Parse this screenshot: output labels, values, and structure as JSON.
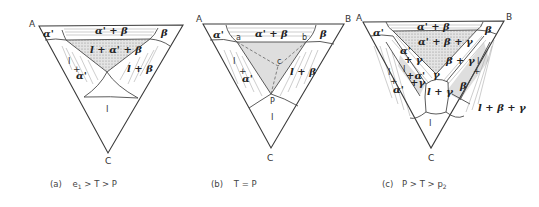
{
  "figure": {
    "vertices": {
      "A": "A",
      "B": "B",
      "C": "C"
    },
    "panels": [
      {
        "id": "a",
        "caption": "(a)  e₁ > T > P",
        "caption_parts": {
          "tag": "(a)",
          "cond": "e",
          "sub": "1",
          "rest": " > T > P"
        },
        "regions": [
          "α'",
          "α' + β",
          "β",
          "l + α' + β",
          "l + α'",
          "l + β",
          "l"
        ],
        "labels": {
          "alpha": "α'",
          "alpha_beta": "α' + β",
          "beta": "β",
          "l_alpha_beta": "l + α' + β",
          "l_alpha_l": "l",
          "l_alpha_plus": "+",
          "l_alpha_a": "α'",
          "l_beta": "l + β",
          "l": "l"
        }
      },
      {
        "id": "b",
        "caption": "(b)  T = P",
        "caption_parts": {
          "tag": "(b)",
          "cond": "T = P"
        },
        "regions": [
          "α'",
          "α' + β",
          "β",
          "l + α'",
          "l + β",
          "l"
        ],
        "points": {
          "a": "a",
          "b": "b",
          "c": "c",
          "P": "P"
        },
        "labels": {
          "alpha": "α'",
          "alpha_beta": "α' + β",
          "beta": "β",
          "l_alpha_l": "l",
          "l_alpha_plus": "+",
          "l_alpha_a": "α'",
          "l_beta": "l + β",
          "l": "l"
        }
      },
      {
        "id": "c",
        "caption": "(c)  P > T > p₂",
        "caption_parts": {
          "tag": "(c)",
          "cond": "P > T > p",
          "sub": "2"
        },
        "regions": [
          "α'",
          "α' + β",
          "β",
          "α' + β + γ",
          "α' + γ",
          "β + γ",
          "γ",
          "l + α' + γ",
          "l + γ",
          "l + α'",
          "l + β",
          "l + β + γ",
          "l"
        ],
        "labels": {
          "alpha": "α'",
          "alpha_beta": "α' + β",
          "beta": "β",
          "alpha_beta_gamma": "α' + β + γ",
          "alpha_gamma_a": "α'",
          "alpha_gamma_g": "+ γ",
          "beta_gamma": "β + γ",
          "gamma": "γ",
          "l_alpha_gamma_l": "l",
          "l_alpha_gamma_a": "+α'",
          "l_alpha_gamma_g": "+γ",
          "l_gamma": "l + γ",
          "l_alpha_l": "l",
          "l_alpha_plus": "+",
          "l_alpha_a": "α'",
          "l_beta_l": "l",
          "l_beta_plus": "+",
          "l_beta_b": "β",
          "l_beta_gamma": "l + β + γ",
          "l": "l"
        }
      }
    ]
  }
}
